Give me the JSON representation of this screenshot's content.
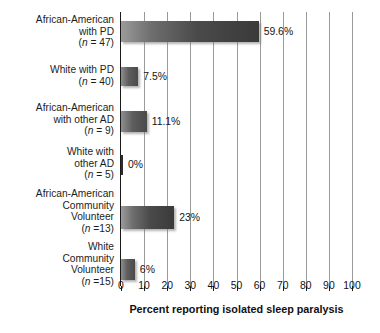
{
  "chart_data": {
    "type": "bar",
    "orientation": "horizontal",
    "title": "",
    "xlabel": "Percent reporting isolated sleep paralysis",
    "ylabel": "",
    "xlim": [
      0,
      100
    ],
    "xticks": [
      "0",
      "10",
      "20",
      "30",
      "40",
      "50",
      "60",
      "70",
      "80",
      "90",
      "100"
    ],
    "grid": true,
    "legend": "none",
    "categories": [
      "African-American with PD (n = 47)",
      "White with PD (n = 40)",
      "African-American with other AD (n = 9)",
      "White with other AD (n = 5)",
      "African-American Community Volunteer (n =13)",
      "White Community Volunteer (n =15)"
    ],
    "values": [
      59.6,
      7.5,
      11.1,
      0,
      23,
      6
    ],
    "value_labels": [
      "59.6%",
      "7.5%",
      "11.1%",
      "0%",
      "23%",
      "6%"
    ],
    "bars": [
      {
        "lines": [
          "African-American",
          "with PD"
        ],
        "n_prefix": "(",
        "n_italic": "n",
        "n_suffix": " = 47)",
        "value": 59.6,
        "value_label": "59.6%"
      },
      {
        "lines": [
          "White with PD"
        ],
        "n_prefix": "(",
        "n_italic": "n",
        "n_suffix": " = 40)",
        "value": 7.5,
        "value_label": "7.5%"
      },
      {
        "lines": [
          "African-American",
          "with other AD"
        ],
        "n_prefix": "(",
        "n_italic": "n",
        "n_suffix": " = 9)",
        "value": 11.1,
        "value_label": "11.1%"
      },
      {
        "lines": [
          "White with",
          "other AD"
        ],
        "n_prefix": "(",
        "n_italic": "n",
        "n_suffix": " = 5)",
        "value": 0,
        "value_label": "0%"
      },
      {
        "lines": [
          "African-American",
          "Community",
          "Volunteer"
        ],
        "n_prefix": "(",
        "n_italic": "n",
        "n_suffix": " =13)",
        "value": 23,
        "value_label": "23%"
      },
      {
        "lines": [
          "White",
          "Community",
          "Volunteer"
        ],
        "n_prefix": "(",
        "n_italic": "n",
        "n_suffix": " =15)",
        "value": 6,
        "value_label": "6%"
      }
    ],
    "colors": {
      "bar_light": "#9b9b9b",
      "bar_dark": "#3a3a3a",
      "axis": "#1a1a1a",
      "grid": "#9a9a9a",
      "text": "#1a1a1a",
      "background": "#ffffff"
    }
  }
}
